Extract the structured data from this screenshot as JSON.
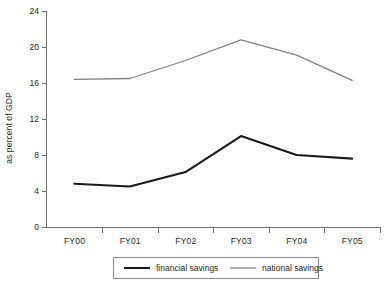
{
  "chart_data": {
    "type": "line",
    "title": "",
    "xlabel": "",
    "ylabel": "as percent of GDP",
    "categories": [
      "FY00",
      "FY01",
      "FY02",
      "FY03",
      "FY04",
      "FY05"
    ],
    "ylim": [
      0,
      24
    ],
    "yticks": [
      0,
      4,
      8,
      12,
      16,
      20,
      24
    ],
    "ytick_labels": [
      "0",
      "4",
      "8",
      "12",
      "16",
      "20",
      "24"
    ],
    "grid": false,
    "legend_position": "bottom-center",
    "series": [
      {
        "name": "financial savings",
        "values": [
          4.8,
          4.5,
          6.1,
          10.1,
          8.0,
          7.6
        ],
        "color": "#1a1a1a",
        "width": 2.1
      },
      {
        "name": "national savings",
        "values": [
          16.4,
          16.5,
          18.5,
          20.8,
          19.1,
          16.3
        ],
        "color": "#808285",
        "width": 1.3
      }
    ]
  },
  "legend": {
    "entries": [
      {
        "label": "financial savings"
      },
      {
        "label": "national savings"
      }
    ]
  },
  "axes": {
    "y_title": "as percent of GDP",
    "y_tick_0": "0",
    "y_tick_1": "4",
    "y_tick_2": "8",
    "y_tick_3": "12",
    "y_tick_4": "16",
    "y_tick_5": "20",
    "y_tick_6": "24",
    "x_cat_0": "FY00",
    "x_cat_1": "FY01",
    "x_cat_2": "FY02",
    "x_cat_3": "FY03",
    "x_cat_4": "FY04",
    "x_cat_5": "FY05"
  }
}
